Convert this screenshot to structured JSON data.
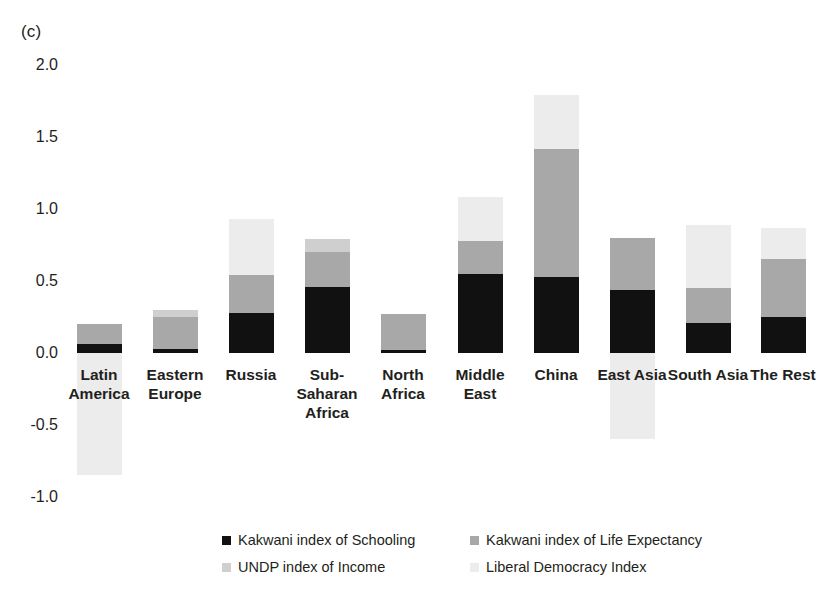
{
  "figure": {
    "panel_label": "(c)"
  },
  "chart_data": {
    "type": "bar",
    "subtype": "stacked-bar-with-negative-values",
    "title": "",
    "xlabel": "",
    "ylabel": "",
    "ylim": [
      -1.0,
      2.0
    ],
    "ytick_labels": [
      "2.0",
      "1.5",
      "1.0",
      "0.5",
      "0.0",
      "-0.5",
      "-1.0"
    ],
    "ytick_values": [
      2.0,
      1.5,
      1.0,
      0.5,
      0.0,
      -0.5,
      -1.0
    ],
    "grid": false,
    "legend_position": "bottom",
    "categories": [
      "Latin\nAmerica",
      "Eastern\nEurope",
      "Russia",
      "Sub-\nSaharan\nAfrica",
      "North\nAfrica",
      "Middle\nEast",
      "China",
      "East Asia",
      "South Asia",
      "The Rest"
    ],
    "categories_flat": [
      "Latin America",
      "Eastern Europe",
      "Russia",
      "Sub-Saharan Africa",
      "North Africa",
      "Middle East",
      "China",
      "East Asia",
      "South Asia",
      "The Rest"
    ],
    "series": [
      {
        "name": "Kakwani index of Schooling",
        "color": "#111111",
        "values": [
          0.06,
          0.03,
          0.28,
          0.46,
          0.02,
          0.55,
          0.53,
          0.44,
          0.21,
          0.25
        ]
      },
      {
        "name": "Kakwani index of Life Expectancy",
        "color": "#a8a8a8",
        "values": [
          0.14,
          0.22,
          0.26,
          0.24,
          0.25,
          0.23,
          0.89,
          0.36,
          0.24,
          0.4
        ]
      },
      {
        "name": "UNDP index of Income",
        "color": "#cfcfcf",
        "values": [
          0.0,
          0.05,
          0.0,
          0.09,
          0.0,
          0.0,
          0.0,
          0.0,
          0.0,
          0.0
        ]
      },
      {
        "name": "Liberal Democracy Index",
        "color": "#ececec",
        "values": [
          -0.85,
          0.0,
          0.39,
          0.0,
          0.0,
          0.3,
          0.37,
          -0.6,
          0.44,
          0.22
        ]
      }
    ],
    "totals_positive": [
      0.2,
      0.3,
      0.93,
      0.79,
      0.27,
      1.08,
      1.79,
      0.8,
      0.89,
      0.87
    ],
    "totals_negative": [
      -0.85,
      0.0,
      0.0,
      0.0,
      0.0,
      0.0,
      0.0,
      -0.6,
      0.0,
      0.0
    ]
  },
  "legend": {
    "items": [
      {
        "label": "Kakwani index of Schooling",
        "color": "#111111"
      },
      {
        "label": "Kakwani index of Life Expectancy",
        "color": "#a8a8a8"
      },
      {
        "label": "UNDP index of Income",
        "color": "#cfcfcf"
      },
      {
        "label": "Liberal Democracy Index",
        "color": "#ececec"
      }
    ]
  }
}
